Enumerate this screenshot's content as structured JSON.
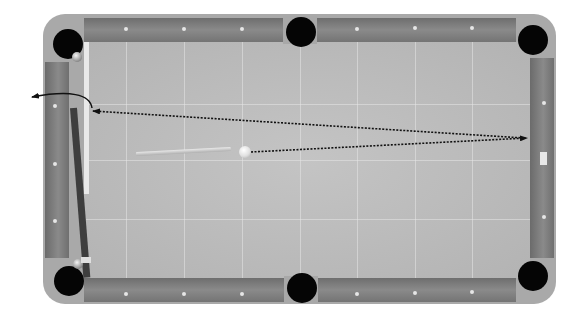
{
  "game": {
    "type": "pool-table-top-view",
    "aim_guide": {
      "cue_ball": {
        "x": 245,
        "y": 152
      },
      "first_cushion_hit": {
        "x": 527,
        "y": 138
      },
      "second_cushion_hit": {
        "x": 92,
        "y": 111
      },
      "exit_arrow_end": {
        "x": 30,
        "y": 97
      },
      "line_style": "dotted"
    },
    "pockets": [
      "top-left",
      "top-middle",
      "top-right",
      "bottom-left",
      "bottom-middle",
      "bottom-right"
    ],
    "diamonds_per_long_rail_half": 3,
    "colors": {
      "frame": "#a9a9a9",
      "rail": "#7e7e7e",
      "felt": "#bcbcbc",
      "pocket": "#050505",
      "aim_line": "#111111",
      "cue_ball": "#f0f0f0"
    }
  }
}
